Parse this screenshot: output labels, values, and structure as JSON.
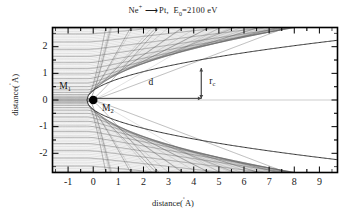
{
  "title": {
    "projectile": "Ne",
    "projectile_charge": "+",
    "arrow": "⟶",
    "target": "Pt,",
    "energy_symbol": "E",
    "energy_sub": "0",
    "energy_value": "=2100 eV"
  },
  "axes": {
    "xlabel_text": "distance(",
    "xlabel_unit": "A",
    "xlabel_close": ")",
    "ylabel_text": "distance(",
    "ylabel_unit": "A",
    "ylabel_close": ")",
    "xticks": [
      "-1",
      "0",
      "1",
      "2",
      "3",
      "4",
      "5",
      "6",
      "7",
      "8",
      "9"
    ],
    "xtick_values": [
      -1,
      0,
      1,
      2,
      3,
      4,
      5,
      6,
      7,
      8,
      9
    ],
    "yticks": [
      "2",
      "1",
      "0",
      "-1",
      "-2"
    ],
    "ytick_values": [
      2,
      1,
      0,
      -1,
      -2
    ],
    "xlim": [
      -1.62,
      9.72
    ],
    "ylim": [
      -2.72,
      2.72
    ],
    "frame_color": "#000000",
    "tick_direction": "in"
  },
  "annotations": {
    "m1_label": "M",
    "m1_sub": "1",
    "m1_x": -1.35,
    "m1_y": 0.42,
    "m2_label": "M",
    "m2_sub": "2",
    "m2_x": 0.35,
    "m2_y": -0.42,
    "d_label": "d",
    "d_x": 2.2,
    "d_y": 0.55,
    "rc_label": "r",
    "rc_sub": "c",
    "rc_x": 4.62,
    "rc_y": 0.6,
    "d_arrow_from": [
      0.0,
      0.06
    ],
    "d_arrow_to": [
      4.3,
      0.06
    ],
    "rc_arrow_x": 4.3,
    "rc_arrow_from_y": 0.06,
    "rc_arrow_to_y": 1.2
  },
  "chart_data": {
    "type": "line",
    "xlabel": "distance(Å)",
    "ylabel": "distance(Å)",
    "xlim": [
      -1.62,
      9.72
    ],
    "ylim": [
      -2.72,
      2.72
    ],
    "grid": false,
    "scatterer": {
      "label": "M2",
      "x": 0.0,
      "y": 0.0,
      "marker": "filled-circle",
      "size": 8
    },
    "shadow_cone": {
      "apex_x": -0.25,
      "radius_formula": "R = 2*sqrt(Z1*Z2*e2*x/E0)",
      "cone_radius_at_x": [
        {
          "x": 0.0,
          "r": 0.3
        },
        {
          "x": 0.5,
          "r": 0.72
        },
        {
          "x": 1.0,
          "r": 0.92
        },
        {
          "x": 2.0,
          "r": 1.17
        },
        {
          "x": 3.0,
          "r": 1.34
        },
        {
          "x": 4.3,
          "r": 1.5
        },
        {
          "x": 6.0,
          "r": 1.66
        },
        {
          "x": 8.0,
          "r": 1.81
        },
        {
          "x": 9.7,
          "r": 1.92
        }
      ]
    },
    "impact_parameters": [
      0.02,
      0.05,
      0.09,
      0.14,
      0.2,
      0.28,
      0.38,
      0.5,
      0.64,
      0.8,
      0.98,
      1.18,
      1.4,
      1.64,
      1.9,
      2.18,
      2.48,
      2.7
    ],
    "n_trajectories_each_side": 18,
    "incoming_direction": "left-to-right",
    "line_color": "#555555",
    "line_width": 0.45,
    "series": [
      {
        "name": "upper-half trajectories",
        "sign": 1
      },
      {
        "name": "lower-half trajectories",
        "sign": -1
      }
    ]
  }
}
